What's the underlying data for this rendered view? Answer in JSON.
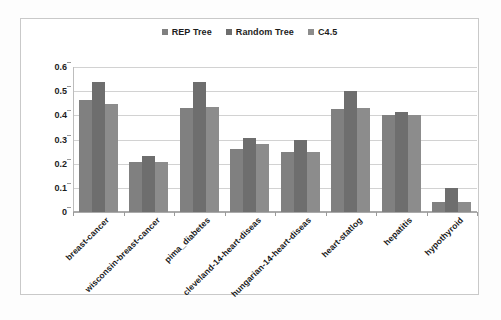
{
  "legend": {
    "position": "top-center",
    "items": [
      {
        "label": "REP Tree",
        "color": "#808080"
      },
      {
        "label": "Random Tree",
        "color": "#6e6e6e"
      },
      {
        "label": "C4.5",
        "color": "#8c8c8c"
      }
    ]
  },
  "axes": {
    "y_ticks": [
      "0",
      "0.1",
      "0.2",
      "0.3",
      "0.4",
      "0.5",
      "0.6"
    ],
    "y_min": 0,
    "y_max": 0.6,
    "ylabel": "",
    "xlabel": ""
  },
  "chart_data": {
    "type": "bar",
    "title": "",
    "xlabel": "",
    "ylabel": "",
    "ylim": [
      0,
      0.6
    ],
    "ytick_step": 0.1,
    "grid": true,
    "legend_position": "top-center",
    "categories": [
      "breast-cancer",
      "wisconsin-breast-cancer",
      "pima_diabetes",
      "cleveland-14-heart-diseas",
      "hungarian-14-heart-diseas",
      "heart-statlog",
      "hepatitis",
      "hypothyroid"
    ],
    "series": [
      {
        "name": "REP Tree",
        "color": "#808080",
        "values": [
          0.465,
          0.205,
          0.43,
          0.26,
          0.25,
          0.425,
          0.4,
          0.04
        ]
      },
      {
        "name": "Random Tree",
        "color": "#6e6e6e",
        "values": [
          0.54,
          0.23,
          0.54,
          0.305,
          0.3,
          0.5,
          0.415,
          0.1
        ]
      },
      {
        "name": "C4.5",
        "color": "#8c8c8c",
        "values": [
          0.445,
          0.205,
          0.435,
          0.28,
          0.25,
          0.43,
          0.4,
          0.04
        ]
      }
    ]
  }
}
